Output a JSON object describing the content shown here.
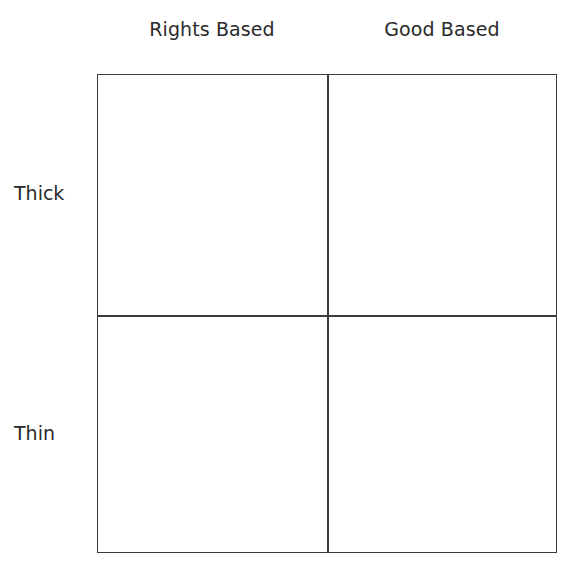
{
  "diagram": {
    "type": "2x2 matrix",
    "columns": [
      {
        "label": "Rights Based"
      },
      {
        "label": "Good Based"
      }
    ],
    "rows": [
      {
        "label": "Thick"
      },
      {
        "label": "Thin"
      }
    ],
    "cells": [
      {
        "row": "Thick",
        "column": "Rights Based",
        "text": ""
      },
      {
        "row": "Thick",
        "column": "Good Based",
        "text": ""
      },
      {
        "row": "Thin",
        "column": "Rights Based",
        "text": ""
      },
      {
        "row": "Thin",
        "column": "Good Based",
        "text": ""
      }
    ],
    "colors": {
      "line": "#3a3a3a",
      "text": "#2a2a2a",
      "background": "#ffffff"
    }
  }
}
